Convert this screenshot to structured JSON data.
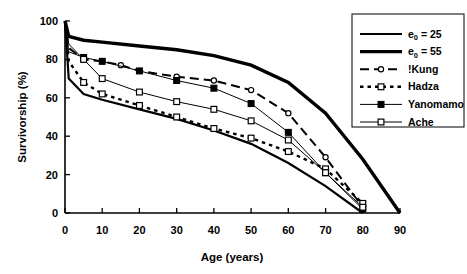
{
  "chart_data": {
    "type": "line",
    "title": "",
    "xlabel": "Age (years)",
    "ylabel": "Survivorship (%)",
    "xlim": [
      0,
      90
    ],
    "ylim": [
      0,
      100
    ],
    "xticks": [
      0,
      10,
      20,
      30,
      40,
      50,
      60,
      70,
      80,
      90
    ],
    "yticks": [
      0,
      20,
      40,
      60,
      80,
      100
    ],
    "grid": false,
    "legend_position": "right-top",
    "series": [
      {
        "name": "e0 = 25",
        "label_main": "e",
        "label_sub": "0",
        "label_rest": " = 25",
        "style": "solid-medium",
        "marker": "none",
        "x": [
          0,
          1,
          5,
          10,
          20,
          30,
          40,
          50,
          60,
          70,
          80
        ],
        "y": [
          100,
          70,
          62,
          59,
          54,
          49,
          43,
          36,
          26,
          14,
          0
        ]
      },
      {
        "name": "e0 = 55",
        "label_main": "e",
        "label_sub": "0",
        "label_rest": " = 55",
        "style": "solid-thick",
        "marker": "none",
        "x": [
          0,
          1,
          5,
          10,
          20,
          30,
          40,
          50,
          60,
          70,
          80,
          90
        ],
        "y": [
          100,
          92,
          90,
          89,
          87,
          85,
          82,
          77,
          68,
          52,
          28,
          0
        ]
      },
      {
        "name": "!Kung",
        "label_main": "!Kung",
        "label_sub": "",
        "label_rest": "",
        "style": "dashed",
        "marker": "open-circle",
        "x": [
          0,
          1,
          5,
          10,
          15,
          20,
          30,
          40,
          50,
          60,
          70,
          80
        ],
        "y": [
          100,
          86,
          80,
          79,
          77,
          74,
          71,
          69,
          64,
          52,
          29,
          3
        ]
      },
      {
        "name": "Hadza",
        "label_main": "Hadza",
        "label_sub": "",
        "label_rest": "",
        "style": "dotted",
        "marker": "open-square",
        "x": [
          0,
          1,
          5,
          10,
          20,
          30,
          40,
          50,
          60,
          70,
          80
        ],
        "y": [
          100,
          79,
          68,
          62,
          56,
          50,
          44,
          39,
          32,
          23,
          5
        ]
      },
      {
        "name": "Yanomamo",
        "label_main": "Yanomamo",
        "label_sub": "",
        "label_rest": "",
        "style": "solid-thin",
        "marker": "filled-square",
        "x": [
          0,
          1,
          5,
          10,
          20,
          30,
          40,
          50,
          60,
          70,
          80
        ],
        "y": [
          100,
          84,
          81,
          79,
          74,
          69,
          65,
          57,
          42,
          21,
          2
        ]
      },
      {
        "name": "Ache",
        "label_main": "Ache",
        "label_sub": "",
        "label_rest": "",
        "style": "solid-thin",
        "marker": "open-square",
        "x": [
          0,
          1,
          5,
          10,
          20,
          30,
          40,
          50,
          60,
          70,
          80
        ],
        "y": [
          100,
          88,
          80,
          70,
          63,
          58,
          54,
          48,
          38,
          21,
          3
        ]
      }
    ]
  },
  "legend": {
    "items": [
      {
        "text": "e",
        "sub": "0",
        "rest": " = 25"
      },
      {
        "text": "e",
        "sub": "0",
        "rest": " = 55"
      },
      {
        "text": "!Kung",
        "sub": "",
        "rest": ""
      },
      {
        "text": "Hadza",
        "sub": "",
        "rest": ""
      },
      {
        "text": "Yanomamo",
        "sub": "",
        "rest": ""
      },
      {
        "text": "Ache",
        "sub": "",
        "rest": ""
      }
    ]
  },
  "axes": {
    "x_label": "Age (years)",
    "y_label": "Survivorship (%)",
    "x_tick_labels": [
      "0",
      "10",
      "20",
      "30",
      "40",
      "50",
      "60",
      "70",
      "80",
      "90"
    ],
    "y_tick_labels": [
      "0",
      "20",
      "40",
      "60",
      "80",
      "100"
    ]
  },
  "colors": {
    "foreground": "#000000",
    "background": "#ffffff"
  }
}
